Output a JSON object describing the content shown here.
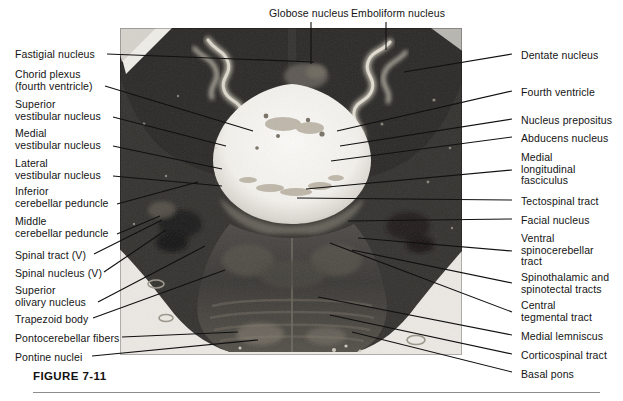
{
  "figure": {
    "caption": "FIGURE 7-11",
    "plate_alt": "brainstem-cerebellum-cross-section"
  },
  "labels_top": [
    {
      "id": "globose-nucleus",
      "text": "Globose nucleus",
      "x": 269,
      "y": 8,
      "lx": 311,
      "ly": 22,
      "tx": 311,
      "ty": 64
    },
    {
      "id": "emboliform-nucleus",
      "text": "Emboliform nucleus",
      "x": 351,
      "y": 8,
      "lx": 386,
      "ly": 22,
      "tx": 386,
      "ty": 50
    }
  ],
  "labels_left": [
    {
      "id": "fastigial-nucleus",
      "text": "Fastigial nucleus",
      "x": 15,
      "y": 49,
      "lx": 107,
      "ly": 54,
      "tx": 314,
      "ty": 62
    },
    {
      "id": "choroid-plexus",
      "text": "Chorid plexus\n(fourth ventricle)",
      "x": 15,
      "y": 69,
      "lx": 105,
      "ly": 86,
      "tx": 253,
      "ty": 131
    },
    {
      "id": "superior-vestibular-nucleus",
      "text": "Superior\nvestibular nucleus",
      "x": 15,
      "y": 99,
      "lx": 113,
      "ly": 117,
      "tx": 226,
      "ty": 146
    },
    {
      "id": "medial-vestibular-nucleus",
      "text": "Medial\nvestibular nucleus",
      "x": 15,
      "y": 128,
      "lx": 113,
      "ly": 146,
      "tx": 222,
      "ty": 169
    },
    {
      "id": "lateral-vestibular-nucleus",
      "text": "Lateral\nvestibular nucleus",
      "x": 15,
      "y": 158,
      "lx": 113,
      "ly": 176,
      "tx": 222,
      "ty": 186
    },
    {
      "id": "inferior-cerebellar-peduncle",
      "text": "Inferior\ncerebellar peduncle",
      "x": 15,
      "y": 186,
      "lx": 117,
      "ly": 204,
      "tx": 198,
      "ty": 182
    },
    {
      "id": "middle-cerebellar-peduncle",
      "text": "Middle\ncerebellar peduncle",
      "x": 15,
      "y": 216,
      "lx": 117,
      "ly": 234,
      "tx": 160,
      "ty": 216
    },
    {
      "id": "spinal-tract-v",
      "text": "Spinal tract (V)",
      "x": 15,
      "y": 250,
      "lx": 94,
      "ly": 254,
      "tx": 162,
      "ty": 220
    },
    {
      "id": "spinal-nucleus-v",
      "text": "Spinal nucleus (V)",
      "x": 15,
      "y": 268,
      "lx": 104,
      "ly": 272,
      "tx": 166,
      "ty": 230
    },
    {
      "id": "superior-olivary-nucleus",
      "text": "Superior\nolivary nucleus",
      "x": 15,
      "y": 285,
      "lx": 98,
      "ly": 302,
      "tx": 205,
      "ty": 246
    },
    {
      "id": "trapezoid-body",
      "text": "Trapezoid body",
      "x": 15,
      "y": 314,
      "lx": 93,
      "ly": 318,
      "tx": 225,
      "ty": 270
    },
    {
      "id": "pontocerebellar-fibers",
      "text": "Pontocerebellar fibers",
      "x": 15,
      "y": 333,
      "lx": 122,
      "ly": 337,
      "tx": 238,
      "ty": 332
    },
    {
      "id": "pontine-nuclei",
      "text": "Pontine nuclei",
      "x": 15,
      "y": 352,
      "lx": 92,
      "ly": 356,
      "tx": 258,
      "ty": 340
    }
  ],
  "labels_right": [
    {
      "id": "dentate-nucleus",
      "text": "Dentate nucleus",
      "x": 521,
      "y": 50,
      "lx": 512,
      "ly": 54,
      "tx": 404,
      "ty": 72
    },
    {
      "id": "fourth-ventricle",
      "text": "Fourth ventricle",
      "x": 521,
      "y": 87,
      "lx": 512,
      "ly": 91,
      "tx": 337,
      "ty": 131
    },
    {
      "id": "nucleus-prepositus",
      "text": "Nucleus prepositus",
      "x": 521,
      "y": 115,
      "lx": 512,
      "ly": 119,
      "tx": 340,
      "ty": 146
    },
    {
      "id": "abducens-nucleus",
      "text": "Abducens nucleus",
      "x": 521,
      "y": 133,
      "lx": 512,
      "ly": 137,
      "tx": 331,
      "ty": 161
    },
    {
      "id": "medial-longitudinal-fasciculus",
      "text": "Medial\nlongitudinal\nfasciculus",
      "x": 521,
      "y": 152,
      "lx": 512,
      "ly": 170,
      "tx": 306,
      "ty": 189
    },
    {
      "id": "tectospinal-tract",
      "text": "Tectospinal tract",
      "x": 521,
      "y": 196,
      "lx": 512,
      "ly": 200,
      "tx": 297,
      "ty": 198
    },
    {
      "id": "facial-nucleus",
      "text": "Facial nucleus",
      "x": 521,
      "y": 215,
      "lx": 512,
      "ly": 219,
      "tx": 348,
      "ty": 221
    },
    {
      "id": "ventral-spinocerebellar-tract",
      "text": "Ventral\nspinocerebellar\ntract",
      "x": 521,
      "y": 233,
      "lx": 512,
      "ly": 251,
      "tx": 358,
      "ty": 238
    },
    {
      "id": "spinothalamic-spinotectal-tracts",
      "text": "Spinothalamic and\nspinotectal tracts",
      "x": 521,
      "y": 272,
      "lx": 512,
      "ly": 283,
      "tx": 352,
      "ty": 250
    },
    {
      "id": "central-tegmental-tract",
      "text": "Central\ntegmental tract",
      "x": 521,
      "y": 300,
      "lx": 512,
      "ly": 312,
      "tx": 330,
      "ty": 243
    },
    {
      "id": "medial-lemniscus",
      "text": "Medial lemniscus",
      "x": 521,
      "y": 331,
      "lx": 512,
      "ly": 335,
      "tx": 318,
      "ty": 297
    },
    {
      "id": "corticospinal-tract",
      "text": "Corticospinal tract",
      "x": 521,
      "y": 350,
      "lx": 512,
      "ly": 354,
      "tx": 330,
      "ty": 315
    },
    {
      "id": "basal-pons",
      "text": "Basal pons",
      "x": 521,
      "y": 369,
      "lx": 512,
      "ly": 372,
      "tx": 352,
      "ty": 332
    }
  ],
  "colors": {
    "leader_line": "#111111",
    "text": "#141414",
    "rule": "#8d8d8d",
    "plate_dark": "#2e2e2e",
    "plate_light": "#f2f0ec"
  }
}
